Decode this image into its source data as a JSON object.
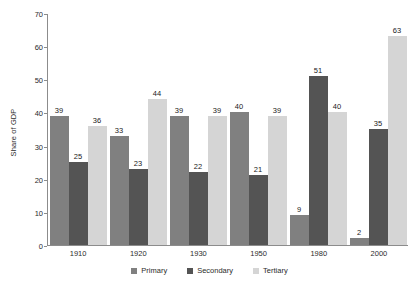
{
  "chart_data": {
    "type": "bar",
    "title": "",
    "subtitle": "",
    "xlabel": "",
    "ylabel": "Share of GDP",
    "categories": [
      "1910",
      "1920",
      "1930",
      "1950",
      "1980",
      "2000"
    ],
    "series": [
      {
        "name": "Primary",
        "color": "#808080",
        "values": [
          39,
          33,
          39,
          40,
          9,
          2
        ]
      },
      {
        "name": "Secondary",
        "color": "#545454",
        "values": [
          25,
          23,
          22,
          21,
          51,
          35
        ]
      },
      {
        "name": "Tertiary",
        "color": "#d5d5d5",
        "values": [
          36,
          44,
          39,
          39,
          40,
          63
        ]
      }
    ],
    "ylim": [
      0,
      70
    ],
    "yticks": [
      0,
      10,
      20,
      30,
      40,
      50,
      60,
      70
    ],
    "ytick_labels": [
      "0",
      "10",
      "20",
      "30",
      "40",
      "50",
      "60",
      "70"
    ],
    "grid": false,
    "data_labels": true,
    "legend_position": "bottom"
  }
}
